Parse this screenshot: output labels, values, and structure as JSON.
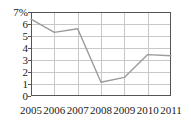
{
  "chart_data": {
    "type": "line",
    "title": "",
    "subtitle": "",
    "xlabel": "",
    "ylabel": "",
    "categories": [
      "2005",
      "2006",
      "2007",
      "2008",
      "2009",
      "2010",
      "2011"
    ],
    "x": [
      2005,
      2006,
      2007,
      2008,
      2009,
      2010,
      2011
    ],
    "values": [
      6.4,
      5.3,
      5.6,
      1.15,
      1.55,
      3.45,
      3.35
    ],
    "series": [
      {
        "name": "",
        "values": [
          6.4,
          5.3,
          5.6,
          1.15,
          1.55,
          3.45,
          3.35
        ]
      }
    ],
    "ylim": [
      0,
      7
    ],
    "xlim": [
      2005,
      2011
    ],
    "y_ticks": [
      0,
      1,
      2,
      3,
      4,
      5,
      6,
      7
    ],
    "y_tick_labels": [
      "0",
      "1",
      "2",
      "3",
      "4",
      "5",
      "6",
      "7%"
    ],
    "x_ticks": [
      2005,
      2006,
      2007,
      2008,
      2009,
      2010,
      2011
    ],
    "x_tick_labels": [
      "2005",
      "2006",
      "2007",
      "2008",
      "2009",
      "2010",
      "2011"
    ],
    "grid": true,
    "grid_axes": "both",
    "legend": false,
    "legend_position": "none",
    "unit": "%",
    "annotations": []
  },
  "style": {
    "line_color": "#9b9b9b",
    "grid_color": "#c8c8c8",
    "axis_color": "#555555",
    "text_color": "#1a1a1a",
    "background": "#ffffff",
    "line_width": 1.4
  },
  "geometry": {
    "plot_left": 31,
    "plot_right": 171,
    "plot_top": 12,
    "plot_bottom": 96
  },
  "y_labels": [
    {
      "text": "7%",
      "value": 7
    },
    {
      "text": "6",
      "value": 6
    },
    {
      "text": "5",
      "value": 5
    },
    {
      "text": "4",
      "value": 4
    },
    {
      "text": "3",
      "value": 3
    },
    {
      "text": "2",
      "value": 2
    },
    {
      "text": "1",
      "value": 1
    },
    {
      "text": "0",
      "value": 0
    }
  ],
  "x_labels": [
    {
      "text": "2005",
      "value": 2005
    },
    {
      "text": "2006",
      "value": 2006
    },
    {
      "text": "2007",
      "value": 2007
    },
    {
      "text": "2008",
      "value": 2008
    },
    {
      "text": "2009",
      "value": 2009
    },
    {
      "text": "2010",
      "value": 2010
    },
    {
      "text": "2011",
      "value": 2011
    }
  ]
}
